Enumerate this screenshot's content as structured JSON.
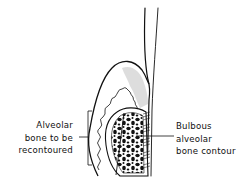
{
  "figure": {
    "type": "dental cross-section diagram",
    "labels": {
      "left": {
        "lines": [
          "Alveolar",
          "bone to be",
          "recontoured"
        ]
      },
      "right": {
        "lines": [
          "Bulbous",
          "alveolar",
          "bone contour"
        ]
      }
    },
    "colors": {
      "ink": "#111111",
      "background": "#ffffff",
      "gingiva_shade": "#d9d9d9"
    }
  }
}
